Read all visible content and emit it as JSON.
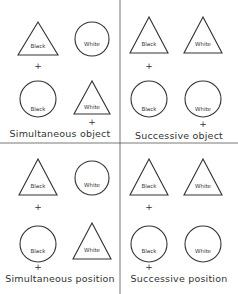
{
  "panels": [
    {
      "caption": "Simultaneous object",
      "top_left": {
        "shape": "triangle",
        "label": "Black"
      },
      "top_right": {
        "shape": "circle",
        "label": "White"
      },
      "bottom_left": {
        "shape": "circle",
        "label": "Black"
      },
      "bottom_right": {
        "shape": "triangle",
        "label": "White"
      },
      "plus_marks": [
        "+",
        "+"
      ]
    },
    {
      "caption": "Successive object",
      "top_left": {
        "shape": "triangle",
        "label": "Black"
      },
      "top_right": {
        "shape": "triangle",
        "label": "White"
      },
      "bottom_left": {
        "shape": "circle",
        "label": "Black"
      },
      "bottom_right": {
        "shape": "circle",
        "label": "White"
      },
      "plus_marks": [
        "+",
        "+"
      ]
    },
    {
      "caption": "Simultaneous position",
      "top_left": {
        "shape": "triangle",
        "label": "Black"
      },
      "top_right": {
        "shape": "circle",
        "label": "White"
      },
      "bottom_left": {
        "shape": "circle",
        "label": "Black"
      },
      "bottom_right": {
        "shape": "triangle",
        "label": "White"
      },
      "plus_marks": [
        "+",
        "+"
      ]
    },
    {
      "caption": "Successive position",
      "top_left": {
        "shape": "triangle",
        "label": "Black"
      },
      "top_right": {
        "shape": "triangle",
        "label": "White"
      },
      "bottom_left": {
        "shape": "circle",
        "label": "Black"
      },
      "bottom_right": {
        "shape": "circle",
        "label": "White"
      },
      "plus_marks": [
        "+",
        "+"
      ]
    }
  ]
}
